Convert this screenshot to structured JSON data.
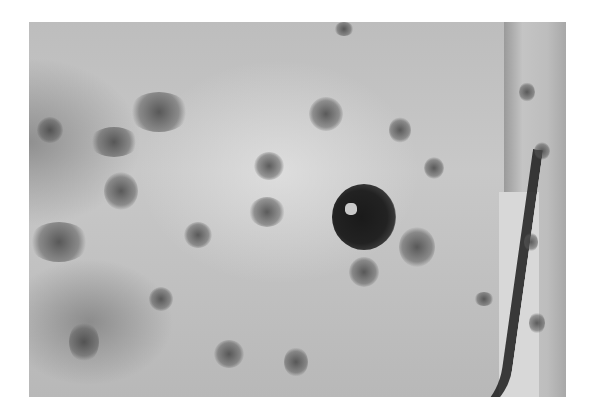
{
  "image": {
    "description": "Grayscale clinical photograph of skin showing numerous scattered dark macules and patches with one large dark nodule",
    "frame": {
      "x": 29,
      "y": 22,
      "width": 537,
      "height": 375
    },
    "background_color": "#ffffff",
    "tone": "grayscale"
  }
}
